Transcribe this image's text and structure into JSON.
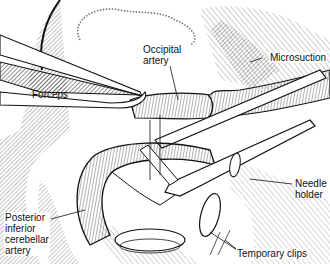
{
  "figure": {
    "labels": {
      "occipital_artery": "Occipital\nartery",
      "occipital_artery_line1": "Occipital",
      "occipital_artery_line2": "artery",
      "microsuction": "Microsuction",
      "forceps": "Forceps",
      "needle_holder_line1": "Needle",
      "needle_holder_line2": "holder",
      "pica_line1": "Posterior",
      "pica_line2": "inferior",
      "pica_line3": "cerebellar",
      "pica_line4": "artery",
      "temporary_clips": "Temporary clips"
    },
    "colors": {
      "ink": "#111111",
      "background": "#ffffff",
      "shade": "#555555"
    }
  }
}
